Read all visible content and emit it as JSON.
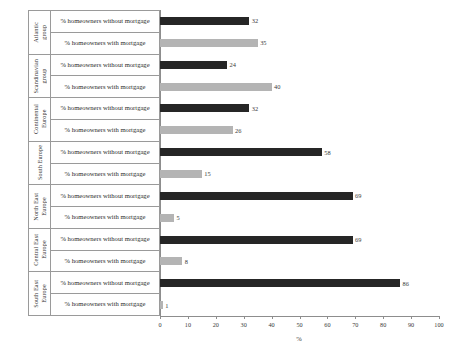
{
  "chart_data": {
    "type": "bar",
    "orientation": "horizontal",
    "title": "",
    "xlabel": "%",
    "ylabel": "",
    "xlim": [
      0,
      100
    ],
    "xticks": [
      0,
      10,
      20,
      30,
      40,
      50,
      60,
      70,
      80,
      90,
      100
    ],
    "grid": false,
    "legend": "none",
    "series_names": [
      "% homeowners without mortgage",
      "% homeowners with mortgage"
    ],
    "series_colors": {
      "without_mortgage": "#262626",
      "with_mortgage": "#b4b4b4"
    },
    "categories": [
      "Atlantic group",
      "Scandinavian group",
      "Continental Europe",
      "South Europe",
      "North East Europe",
      "Central East Europe",
      "South East Europe"
    ],
    "series": [
      {
        "name": "% homeowners without mortgage",
        "values": [
          32,
          24,
          32,
          58,
          69,
          69,
          86
        ]
      },
      {
        "name": "% homeowners with mortgage",
        "values": [
          35,
          40,
          26,
          15,
          5,
          8,
          1
        ]
      }
    ]
  },
  "groups": [
    {
      "name": "Atlantic\ngroup",
      "rows": [
        {
          "label": "% homeowners without mortgage",
          "value": 32,
          "style": "dark"
        },
        {
          "label": "% homeowners with mortgage",
          "value": 35,
          "style": "light"
        }
      ]
    },
    {
      "name": "Scandinavian\ngroup",
      "rows": [
        {
          "label": "% homeowners without mortgage",
          "value": 24,
          "style": "dark"
        },
        {
          "label": "% homeowners with mortgage",
          "value": 40,
          "style": "light"
        }
      ]
    },
    {
      "name": "Continental\nEurope",
      "rows": [
        {
          "label": "% homeowners without mortgage",
          "value": 32,
          "style": "dark"
        },
        {
          "label": "% homeowners with mortgage",
          "value": 26,
          "style": "light"
        }
      ]
    },
    {
      "name": "South Europe",
      "rows": [
        {
          "label": "% homeowners without mortgage",
          "value": 58,
          "style": "dark"
        },
        {
          "label": "% homeowners with mortgage",
          "value": 15,
          "style": "light"
        }
      ]
    },
    {
      "name": "North East\nEurope",
      "rows": [
        {
          "label": "% homeowners without mortgage",
          "value": 69,
          "style": "dark"
        },
        {
          "label": "% homeowners with mortgage",
          "value": 5,
          "style": "light"
        }
      ]
    },
    {
      "name": "Central East\nEurope",
      "rows": [
        {
          "label": "% homeowners without mortgage",
          "value": 69,
          "style": "dark"
        },
        {
          "label": "% homeowners with mortgage",
          "value": 8,
          "style": "light"
        }
      ]
    },
    {
      "name": "South East\nEurope",
      "rows": [
        {
          "label": "% homeowners without mortgage",
          "value": 86,
          "style": "dark"
        },
        {
          "label": "% homeowners with mortgage",
          "value": 1,
          "style": "light"
        }
      ]
    }
  ],
  "axis": {
    "title": "%",
    "ticks": [
      "0",
      "10",
      "20",
      "30",
      "40",
      "50",
      "60",
      "70",
      "80",
      "90",
      "100"
    ]
  }
}
